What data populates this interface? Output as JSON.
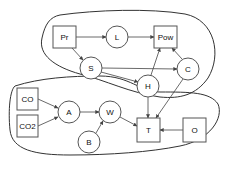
{
  "diagram": {
    "type": "causal-graph",
    "nodes": [
      {
        "id": "Pr",
        "label": "Pr",
        "shape": "square"
      },
      {
        "id": "L",
        "label": "L",
        "shape": "circle"
      },
      {
        "id": "Pow",
        "label": "Pow",
        "shape": "square"
      },
      {
        "id": "S",
        "label": "S",
        "shape": "circle"
      },
      {
        "id": "C",
        "label": "C",
        "shape": "circle"
      },
      {
        "id": "H",
        "label": "H",
        "shape": "circle"
      },
      {
        "id": "CO",
        "label": "CO",
        "shape": "square"
      },
      {
        "id": "CO2",
        "label": "CO2",
        "shape": "square"
      },
      {
        "id": "A",
        "label": "A",
        "shape": "circle"
      },
      {
        "id": "W",
        "label": "W",
        "shape": "circle"
      },
      {
        "id": "B",
        "label": "B",
        "shape": "circle"
      },
      {
        "id": "T",
        "label": "T",
        "shape": "square"
      },
      {
        "id": "O",
        "label": "O",
        "shape": "square"
      }
    ],
    "edges": [
      {
        "from": "Pr",
        "to": "L"
      },
      {
        "from": "L",
        "to": "Pow"
      },
      {
        "from": "Pr",
        "to": "S"
      },
      {
        "from": "S",
        "to": "C"
      },
      {
        "from": "S",
        "to": "H"
      },
      {
        "from": "H",
        "to": "Pow"
      },
      {
        "from": "C",
        "to": "Pow"
      },
      {
        "from": "H",
        "to": "T"
      },
      {
        "from": "C",
        "to": "T"
      },
      {
        "from": "CO",
        "to": "A"
      },
      {
        "from": "CO2",
        "to": "A"
      },
      {
        "from": "A",
        "to": "W"
      },
      {
        "from": "B",
        "to": "W"
      },
      {
        "from": "W",
        "to": "T"
      },
      {
        "from": "O",
        "to": "T"
      }
    ],
    "groups": [
      {
        "name": "upper-group",
        "members": [
          "Pr",
          "L",
          "Pow",
          "S",
          "C",
          "H"
        ]
      },
      {
        "name": "lower-group",
        "members": [
          "CO",
          "CO2",
          "A",
          "W",
          "B",
          "T",
          "O"
        ]
      }
    ]
  }
}
